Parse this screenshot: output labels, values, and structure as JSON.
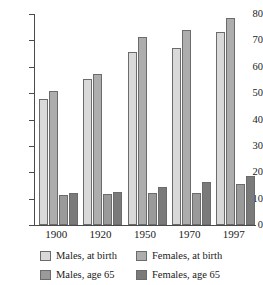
{
  "chart_data": {
    "type": "bar",
    "title": "",
    "subtitle": "",
    "xlabel": "",
    "ylabel": "",
    "categories": [
      "1900",
      "1920",
      "1950",
      "1970",
      "1997"
    ],
    "series": [
      {
        "name": "Males, at birth",
        "color": "#d9d9d9",
        "values": [
          47.9,
          55.5,
          65.6,
          67.1,
          73.0
        ]
      },
      {
        "name": "Females, at birth",
        "color": "#adadad",
        "values": [
          50.9,
          57.4,
          71.1,
          74.0,
          78.5
        ]
      },
      {
        "name": "Males, age 65",
        "color": "#9a9a9a",
        "values": [
          11.3,
          11.8,
          12.3,
          12.3,
          15.4
        ]
      },
      {
        "name": "Females, age 65",
        "color": "#7a7a7a",
        "values": [
          12.1,
          12.4,
          14.5,
          16.2,
          18.4
        ]
      }
    ],
    "ylim": [
      0,
      80
    ],
    "yticks": [
      0,
      10,
      20,
      30,
      40,
      50,
      60,
      70,
      80
    ],
    "ytick_labels": [
      "0",
      "10",
      "20",
      "30",
      "40",
      "50",
      "60",
      "70",
      "80"
    ],
    "grid": false,
    "legend_position": "bottom"
  },
  "legend": {
    "items": [
      {
        "label": "Males, at birth",
        "swatch": "s0"
      },
      {
        "label": "Females, at birth",
        "swatch": "s1"
      },
      {
        "label": "Males, age 65",
        "swatch": "s2"
      },
      {
        "label": "Females, age 65",
        "swatch": "s3"
      }
    ]
  },
  "axes": {
    "y_max": 80,
    "y_min": 0
  }
}
